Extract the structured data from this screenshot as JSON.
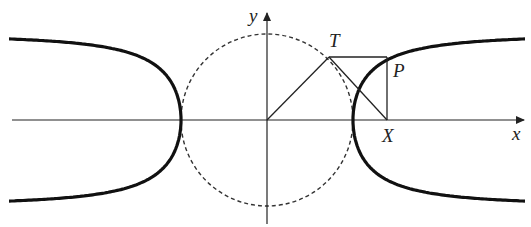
{
  "diagram": {
    "width": 531,
    "height": 227,
    "origin": [
      267,
      120
    ],
    "radius": 86,
    "x_axis": {
      "from": 12,
      "to": 524,
      "label": "x",
      "label_pos": [
        512,
        140
      ]
    },
    "y_axis": {
      "from": 224,
      "to": 13,
      "label": "y",
      "label_pos": [
        249,
        22
      ]
    },
    "points": {
      "T": {
        "label": "T",
        "pos": [
          329,
          57
        ],
        "label_pos": [
          329,
          47
        ]
      },
      "P": {
        "label": "P",
        "pos": [
          387,
          57
        ],
        "label_pos": [
          393,
          77
        ]
      },
      "X": {
        "label": "X",
        "pos": [
          387,
          120
        ],
        "label_pos": [
          382,
          142
        ]
      }
    },
    "curve": {
      "x_extent": 258,
      "description": "y = ±r·sqrt(1 − r²/x²)"
    },
    "colors": {
      "stroke": "#222222",
      "curve": "#111111",
      "circle": "#333333"
    }
  }
}
